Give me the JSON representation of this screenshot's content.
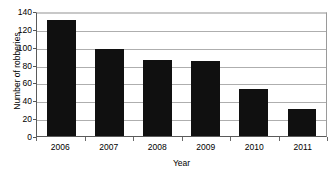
{
  "chart_data": {
    "type": "bar",
    "title": "",
    "subtitle": "",
    "xlabel": "Year",
    "ylabel": "Number of robberies",
    "categories": [
      "2006",
      "2007",
      "2008",
      "2009",
      "2010",
      "2011"
    ],
    "values": [
      130,
      97,
      85,
      84,
      53,
      30
    ],
    "series": [
      {
        "name": "Number of robberies",
        "values": [
          130,
          97,
          85,
          84,
          53,
          30
        ]
      }
    ],
    "ylim": [
      0,
      140
    ],
    "ytick_step": 20,
    "yticks": [
      "140",
      "120",
      "100",
      "80",
      "60",
      "40",
      "20",
      "0"
    ],
    "ytick_values": [
      140,
      120,
      100,
      80,
      60,
      40,
      20,
      0
    ],
    "xlim_categories": 6,
    "grid": "horizontal",
    "legend": "none",
    "legend_position": "none",
    "bar_color": "#101010",
    "gridline_color": "#aeaeae",
    "axis_color": "#5a5a5a",
    "background": "#ffffff",
    "annotations": []
  }
}
